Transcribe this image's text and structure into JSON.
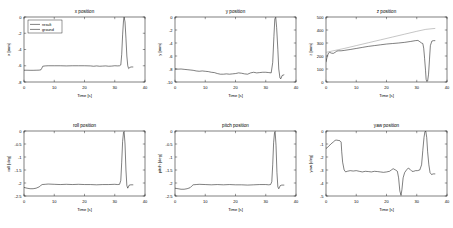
{
  "figure": {
    "background": "#ffffff",
    "rows": 2,
    "cols": 3
  },
  "legend": {
    "entries": [
      {
        "label": "result",
        "color": "#000000"
      },
      {
        "label": "ground",
        "color": "#000000"
      }
    ]
  },
  "common": {
    "xlabel": "Time [s]",
    "xticks": [
      "0",
      "10",
      "20",
      "30",
      "40"
    ],
    "xlim": [
      0,
      40
    ]
  },
  "chart_data": [
    {
      "id": "x-position",
      "type": "line",
      "title": "x position",
      "xlabel": "Time [s]",
      "ylabel": "x [mm]",
      "xlim": [
        0,
        40
      ],
      "ylim": [
        -8,
        0
      ],
      "xticks": [
        0,
        10,
        20,
        30,
        40
      ],
      "yticks": [
        0,
        -2,
        -4,
        -6,
        -8
      ],
      "ytick_labels": [
        "0",
        "-2",
        "-4",
        "-6",
        "-8"
      ],
      "grid": false,
      "legend": [
        "result",
        "ground"
      ],
      "legend_position": "upper-left",
      "series": [
        {
          "name": "result",
          "color": "#000000",
          "x": [
            0,
            1,
            2,
            3,
            4,
            5,
            5.6,
            5.9,
            6.2,
            7,
            8,
            10,
            12,
            14,
            16,
            18,
            20,
            22,
            23,
            24,
            25,
            26,
            27,
            28,
            29,
            30,
            31,
            31.6,
            32,
            32.3,
            32.6,
            32.9,
            33.1,
            33.4,
            33.7,
            34,
            34.3,
            34.6,
            35,
            35.4,
            36
          ],
          "y": [
            -6.55,
            -6.55,
            -6.56,
            -6.56,
            -6.55,
            -6.54,
            -6.5,
            -6.3,
            -6.06,
            -6.02,
            -6.0,
            -6.0,
            -6.0,
            -6.02,
            -6.0,
            -6.0,
            -6.0,
            -6.02,
            -6.06,
            -6.02,
            -6.06,
            -6.04,
            -6.02,
            -6.06,
            -6.04,
            -6.0,
            -6.02,
            -6.0,
            -5.9,
            -4.6,
            -2.2,
            -0.4,
            -0.02,
            -0.6,
            -2.6,
            -4.8,
            -6.0,
            -6.35,
            -6.2,
            -6.15,
            -6.15
          ]
        }
      ]
    },
    {
      "id": "y-position",
      "type": "line",
      "title": "y position",
      "xlabel": "Time [s]",
      "ylabel": "y [mm]",
      "xlim": [
        0,
        40
      ],
      "ylim": [
        -10,
        0
      ],
      "xticks": [
        0,
        10,
        20,
        30,
        40
      ],
      "yticks": [
        0,
        -2,
        -4,
        -6,
        -8,
        -10
      ],
      "ytick_labels": [
        "0",
        "-2",
        "-4",
        "-6",
        "-8",
        "-10"
      ],
      "grid": false,
      "series": [
        {
          "name": "result",
          "color": "#000000",
          "x": [
            0,
            1,
            2,
            3,
            4,
            5,
            6,
            7,
            8,
            9,
            10,
            11,
            12,
            13,
            14,
            15,
            16,
            17,
            18,
            19,
            20,
            21,
            22,
            23,
            24,
            25,
            26,
            27,
            28,
            29,
            30,
            31,
            31.8,
            32.3,
            32.7,
            33,
            33.3,
            33.6,
            34,
            34.3,
            34.7,
            35,
            35.4,
            36
          ],
          "y": [
            -8.0,
            -8.02,
            -8.0,
            -8.05,
            -8.1,
            -8.15,
            -8.2,
            -8.3,
            -8.35,
            -8.3,
            -8.35,
            -8.4,
            -8.5,
            -8.55,
            -8.7,
            -8.8,
            -8.8,
            -8.75,
            -8.8,
            -8.75,
            -8.7,
            -8.6,
            -8.65,
            -8.75,
            -8.8,
            -8.6,
            -8.5,
            -8.6,
            -8.55,
            -8.5,
            -8.5,
            -8.55,
            -8.6,
            -7.0,
            -3.0,
            -0.3,
            -0.05,
            -1.6,
            -5.0,
            -8.0,
            -9.4,
            -9.5,
            -9.0,
            -8.9
          ]
        }
      ]
    },
    {
      "id": "z-position",
      "type": "line",
      "title": "z position",
      "xlabel": "Time [s]",
      "ylabel": "z [mm]",
      "xlim": [
        0,
        40
      ],
      "ylim": [
        0,
        500
      ],
      "xticks": [
        0,
        10,
        20,
        30,
        40
      ],
      "yticks": [
        0,
        100,
        200,
        300,
        400,
        500
      ],
      "ytick_labels": [
        "0",
        "100",
        "200",
        "300",
        "400",
        "500"
      ],
      "grid": false,
      "series": [
        {
          "name": "ground",
          "color": "#8c8c8c",
          "x": [
            0,
            2,
            4,
            6,
            10,
            14,
            18,
            22,
            26,
            30,
            33,
            36
          ],
          "y": [
            228,
            238,
            248,
            258,
            280,
            302,
            324,
            346,
            368,
            390,
            405,
            412
          ]
        },
        {
          "name": "result",
          "color": "#000000",
          "x": [
            0,
            0.4,
            0.8,
            1.2,
            1.8,
            2.4,
            3,
            3.6,
            4.2,
            5,
            6,
            8,
            10,
            12,
            14,
            16,
            18,
            20,
            22,
            24,
            26,
            28,
            29.5,
            30.4,
            31,
            31.6,
            32,
            32.3,
            32.6,
            32.9,
            33.1,
            33.3,
            33.6,
            33.9,
            34.2,
            34.5,
            35,
            35.5,
            36
          ],
          "y": [
            155,
            195,
            222,
            228,
            222,
            220,
            228,
            238,
            240,
            240,
            243,
            250,
            258,
            266,
            274,
            280,
            286,
            292,
            296,
            300,
            305,
            312,
            318,
            320,
            310,
            300,
            296,
            260,
            180,
            90,
            20,
            5,
            8,
            60,
            170,
            280,
            315,
            318,
            318
          ]
        }
      ]
    },
    {
      "id": "roll-position",
      "type": "line",
      "title": "roll position",
      "xlabel": "Time [s]",
      "ylabel": "roll [deg]",
      "xlim": [
        0,
        40
      ],
      "ylim": [
        -2.5,
        0
      ],
      "xticks": [
        0,
        10,
        20,
        30,
        40
      ],
      "yticks": [
        0,
        -0.5,
        -1,
        -1.5,
        -2,
        -2.5
      ],
      "ytick_labels": [
        "0",
        "-0.5",
        "-1",
        "-1.5",
        "-2",
        "-2.5"
      ],
      "grid": false,
      "series": [
        {
          "name": "result",
          "color": "#000000",
          "x": [
            0,
            1,
            2,
            3,
            4,
            5,
            5.5,
            6,
            7,
            8,
            10,
            12,
            14,
            16,
            18,
            20,
            22,
            24,
            26,
            28,
            30,
            31,
            31.6,
            32,
            32.3,
            32.6,
            32.9,
            33.1,
            33.4,
            33.7,
            34,
            34.3,
            34.8,
            35.3,
            36
          ],
          "y": [
            -2.17,
            -2.2,
            -2.22,
            -2.22,
            -2.2,
            -2.15,
            -2.1,
            -2.06,
            -2.05,
            -2.04,
            -2.05,
            -2.06,
            -2.05,
            -2.06,
            -2.05,
            -2.06,
            -2.06,
            -2.07,
            -2.06,
            -2.06,
            -2.05,
            -2.06,
            -2.05,
            -1.9,
            -1.2,
            -0.4,
            -0.05,
            -0.02,
            -0.5,
            -1.5,
            -2.1,
            -2.2,
            -2.08,
            -2.07,
            -2.07
          ]
        }
      ]
    },
    {
      "id": "pitch-position",
      "type": "line",
      "title": "pitch position",
      "xlabel": "Time [s]",
      "ylabel": "pitch [deg]",
      "xlim": [
        0,
        40
      ],
      "ylim": [
        -2.5,
        0
      ],
      "xticks": [
        0,
        10,
        20,
        30,
        40
      ],
      "yticks": [
        0,
        -0.5,
        -1,
        -1.5,
        -2,
        -2.5
      ],
      "ytick_labels": [
        "0",
        "-0.5",
        "-1",
        "-1.5",
        "-2",
        "-2.5"
      ],
      "grid": false,
      "series": [
        {
          "name": "result",
          "color": "#000000",
          "x": [
            0,
            1,
            2,
            3,
            4,
            5,
            5.5,
            6,
            7,
            8,
            10,
            12,
            14,
            16,
            18,
            20,
            22,
            24,
            26,
            28,
            30,
            31,
            31.6,
            32,
            32.3,
            32.6,
            32.9,
            33.1,
            33.4,
            33.7,
            34,
            34.3,
            34.8,
            35.3,
            36
          ],
          "y": [
            -2.2,
            -2.22,
            -2.24,
            -2.24,
            -2.22,
            -2.18,
            -2.12,
            -2.07,
            -2.06,
            -2.05,
            -2.06,
            -2.07,
            -2.06,
            -2.07,
            -2.06,
            -2.07,
            -2.07,
            -2.08,
            -2.07,
            -2.06,
            -2.06,
            -2.07,
            -2.06,
            -1.95,
            -1.3,
            -0.45,
            -0.06,
            -0.02,
            -0.55,
            -1.6,
            -2.15,
            -2.22,
            -2.1,
            -2.08,
            -2.08
          ]
        }
      ]
    },
    {
      "id": "yaw-position",
      "type": "line",
      "title": "yaw position",
      "xlabel": "Time [s]",
      "ylabel": "yaw [deg]",
      "xlim": [
        0,
        40
      ],
      "ylim": [
        -5,
        0
      ],
      "xticks": [
        0,
        10,
        20,
        30,
        40
      ],
      "yticks": [
        0,
        -1,
        -2,
        -3,
        -4,
        -5
      ],
      "ytick_labels": [
        "0",
        "-1",
        "-2",
        "-3",
        "-4",
        "-5"
      ],
      "grid": false,
      "series": [
        {
          "name": "result",
          "color": "#000000",
          "x": [
            0,
            0.8,
            1.6,
            2.4,
            3,
            3.4,
            4,
            4.6,
            5,
            5.2,
            5.5,
            6,
            6.5,
            7,
            8,
            9,
            10,
            11,
            12,
            13,
            14,
            15,
            16,
            17,
            18,
            19,
            20,
            21,
            21.6,
            22.2,
            23,
            23.6,
            24,
            24.4,
            24.8,
            25.1,
            25.5,
            26,
            26.6,
            27.2,
            27.8,
            28.4,
            29,
            29.6,
            30.2,
            31,
            31.6,
            32,
            32.4,
            32.7,
            33,
            33.3,
            33.6,
            34,
            34.4,
            34.9,
            35.4,
            36
          ],
          "y": [
            -1.35,
            -1.2,
            -1.0,
            -0.85,
            -0.72,
            -0.7,
            -0.72,
            -0.75,
            -0.85,
            -1.6,
            -2.4,
            -3.0,
            -3.15,
            -3.1,
            -3.05,
            -3.08,
            -3.05,
            -3.1,
            -3.15,
            -3.1,
            -3.12,
            -3.15,
            -3.1,
            -3.12,
            -3.15,
            -3.18,
            -3.15,
            -3.1,
            -3.0,
            -2.9,
            -3.0,
            -3.1,
            -3.6,
            -4.6,
            -4.95,
            -4.5,
            -3.6,
            -3.2,
            -3.0,
            -2.85,
            -2.95,
            -3.1,
            -3.1,
            -3.05,
            -3.05,
            -3.0,
            -2.6,
            -1.5,
            -0.5,
            -0.05,
            -0.02,
            -0.5,
            -1.6,
            -2.6,
            -3.2,
            -3.35,
            -3.3,
            -3.3
          ]
        }
      ]
    }
  ]
}
